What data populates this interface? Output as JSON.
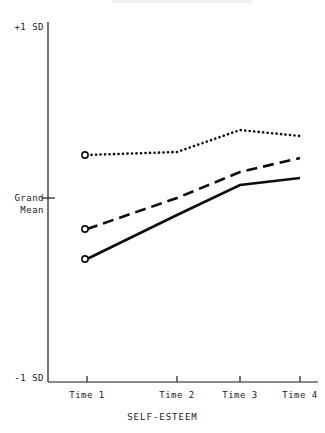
{
  "figure": {
    "title_remnant": "",
    "background_color": "#ffffff",
    "ink_color": "#1a1a1a"
  },
  "labels": {
    "y_top": "+1 SD",
    "y_mid_line1": "Grand",
    "y_mid_line2": "Mean",
    "y_bottom": "-1 SD",
    "x_tick_1": "Time 1",
    "x_tick_2": "Time 2",
    "x_tick_3": "Time 3",
    "x_tick_4": "Time 4",
    "x_axis_title": "SELF-ESTEEM"
  },
  "chart_data": {
    "type": "line",
    "title": "",
    "xlabel": "SELF-ESTEEM",
    "ylabel": "",
    "categories": [
      "Time 1",
      "Time 2",
      "Time 3",
      "Time 4"
    ],
    "x_tick_pixels": [
      87,
      177,
      240,
      300
    ],
    "y_axis": {
      "ticks": [
        "-1 SD",
        "Grand Mean",
        "+1 SD"
      ],
      "tick_values": [
        -1,
        0,
        1
      ],
      "ylim": [
        -1,
        1
      ],
      "grand_mean_pixel": 198,
      "top_pixel": 22,
      "bottom_pixel": 382
    },
    "grid": false,
    "legend": "none",
    "series": [
      {
        "name": "High self-esteem",
        "style": "dotted",
        "marker_at_first_point": "open-circle",
        "values": [
          0.24,
          0.26,
          0.38,
          0.34
        ],
        "y_pixels": [
          155,
          152,
          130,
          136
        ]
      },
      {
        "name": "Moderate self-esteem",
        "style": "dashed",
        "marker_at_first_point": "open-circle",
        "values": [
          -0.17,
          0.0,
          0.14,
          0.22
        ],
        "y_pixels": [
          229,
          198,
          172,
          158
        ]
      },
      {
        "name": "Low self-esteem",
        "style": "solid",
        "marker_at_first_point": "open-circle",
        "values": [
          -0.33,
          -0.09,
          0.07,
          0.11
        ],
        "y_pixels": [
          259,
          215,
          185,
          178
        ]
      }
    ]
  }
}
